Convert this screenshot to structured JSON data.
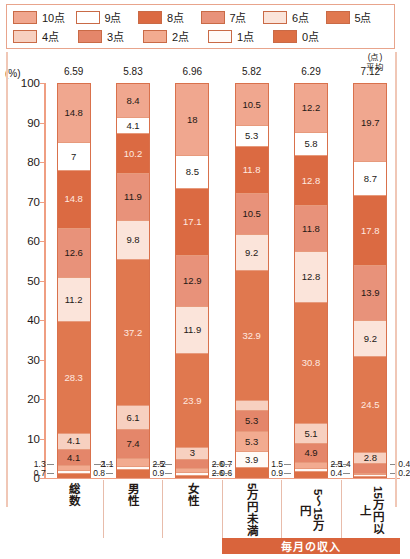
{
  "legend": {
    "rows": [
      [
        {
          "label": "10点",
          "color": "#f0a78f"
        },
        {
          "label": "9点",
          "color": "#ffffff"
        },
        {
          "label": "8点",
          "color": "#db6a42"
        },
        {
          "label": "7点",
          "color": "#e8927a"
        },
        {
          "label": "6点",
          "color": "#fbe4da"
        },
        {
          "label": "5点",
          "color": "#e0784f"
        }
      ],
      [
        {
          "label": "4点",
          "color": "#f7d0c0"
        },
        {
          "label": "3点",
          "color": "#e4866a"
        },
        {
          "label": "2点",
          "color": "#f2ab90"
        },
        {
          "label": "1点",
          "color": "#fffaf7"
        },
        {
          "label": "0点",
          "color": "#dd6f44"
        }
      ]
    ]
  },
  "axis": {
    "unit": "(%)",
    "mean_header_line1": "(点)",
    "mean_header_line2": "平均",
    "yticks": [
      "100",
      "90",
      "80",
      "70",
      "60",
      "50",
      "40",
      "30",
      "20",
      "10",
      "0"
    ]
  },
  "group_label": "毎月の収入",
  "chart_data": {
    "type": "bar",
    "title": "",
    "xlabel": "",
    "ylabel": "(%)",
    "ylim": [
      0,
      100
    ],
    "grid": false,
    "stacked": true,
    "legend_position": "top",
    "categories": [
      "総数",
      "男性",
      "女性",
      "5万円未満",
      "5〜15万円",
      "15万円以上"
    ],
    "means": [
      6.59,
      5.83,
      6.96,
      5.82,
      6.29,
      7.12
    ],
    "series": [
      {
        "name": "10点",
        "color": "#f0a78f",
        "values": [
          14.8,
          8.4,
          18.0,
          10.5,
          12.2,
          19.7
        ]
      },
      {
        "name": "9点",
        "color": "#ffffff",
        "values": [
          7.0,
          4.1,
          8.5,
          5.3,
          5.8,
          8.7
        ]
      },
      {
        "name": "8点",
        "color": "#db6a42",
        "values": [
          14.8,
          10.2,
          17.1,
          11.8,
          12.8,
          17.8
        ]
      },
      {
        "name": "7点",
        "color": "#e8927a",
        "values": [
          12.6,
          11.9,
          12.9,
          10.5,
          11.8,
          13.9
        ]
      },
      {
        "name": "6点",
        "color": "#fbe4da",
        "values": [
          11.2,
          9.8,
          11.9,
          9.2,
          12.8,
          9.2
        ]
      },
      {
        "name": "5点",
        "color": "#e0784f",
        "values": [
          28.3,
          37.2,
          23.9,
          32.9,
          30.8,
          24.5
        ]
      },
      {
        "name": "4点",
        "color": "#f7d0c0",
        "values": [
          4.1,
          6.1,
          3.0,
          2.6,
          5.1,
          2.8
        ]
      },
      {
        "name": "3点",
        "color": "#e4866a",
        "values": [
          4.1,
          7.4,
          2.5,
          5.3,
          4.9,
          2.5
        ]
      },
      {
        "name": "2点",
        "color": "#f2ab90",
        "values": [
          1.3,
          2.0,
          0.9,
          5.3,
          1.5,
          0.4
        ]
      },
      {
        "name": "1点",
        "color": "#fffaf7",
        "values": [
          0.7,
          0.8,
          0.7,
          3.9,
          0.9,
          0.4
        ]
      },
      {
        "name": "0点",
        "color": "#dd6f44",
        "values": [
          1.1,
          2.0,
          0.6,
          2.6,
          1.4,
          0.2
        ]
      }
    ]
  }
}
